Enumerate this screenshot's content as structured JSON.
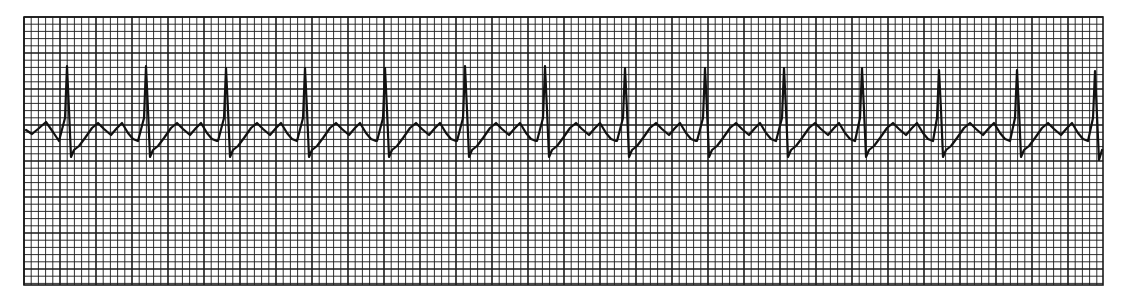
{
  "chart_data": {
    "type": "line",
    "title": "",
    "subtitle": "",
    "xlabel": "",
    "ylabel": "",
    "grid": {
      "on": true,
      "x0": 24,
      "y0": 17,
      "x1": 1103,
      "y1": 285,
      "minor_spacing_px": 7.2,
      "major_every": 5,
      "line_color": "#1a1a1a",
      "background": "#ffffff"
    },
    "trace_color": "#111111",
    "beat_count": 14,
    "r_peak_x_px": [
      67,
      146,
      226,
      305,
      385,
      465,
      545,
      625,
      705,
      784,
      862,
      939,
      1017,
      1095
    ],
    "r_peak_y_px": [
      66,
      66,
      68,
      68,
      68,
      66,
      66,
      68,
      68,
      68,
      68,
      70,
      70,
      71
    ],
    "rr_interval_px": 79,
    "baseline_y_px": 131,
    "s_trough_y_px": 157,
    "beat_template": [
      {
        "dx": -8,
        "y": 141
      },
      {
        "dx": -2,
        "y": 118
      },
      {
        "dx": 0,
        "y": 67
      },
      {
        "dx": 2,
        "y": 110
      },
      {
        "dx": 4,
        "y": 157
      },
      {
        "dx": 7,
        "y": 150
      },
      {
        "dx": 12,
        "y": 146
      },
      {
        "dx": 18,
        "y": 138
      },
      {
        "dx": 25,
        "y": 128
      },
      {
        "dx": 31,
        "y": 123
      },
      {
        "dx": 37,
        "y": 129
      },
      {
        "dx": 44,
        "y": 135
      },
      {
        "dx": 50,
        "y": 128
      },
      {
        "dx": 55,
        "y": 123
      },
      {
        "dx": 61,
        "y": 133
      },
      {
        "dx": 66,
        "y": 139
      },
      {
        "dx": 71,
        "y": 141
      }
    ],
    "lead_in": [
      {
        "x": 26,
        "y": 130
      },
      {
        "x": 32,
        "y": 134
      },
      {
        "x": 38,
        "y": 129
      },
      {
        "x": 46,
        "y": 122
      },
      {
        "x": 53,
        "y": 132
      },
      {
        "x": 59,
        "y": 141
      }
    ],
    "tail": [
      {
        "x": 1099,
        "y": 160
      },
      {
        "x": 1102,
        "y": 150
      }
    ],
    "xlim": [
      24,
      1103
    ],
    "ylim": [
      17,
      285
    ],
    "legend": null
  }
}
